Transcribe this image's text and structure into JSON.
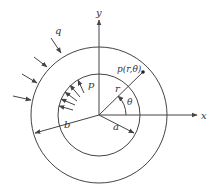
{
  "figure": {
    "labels": {
      "outer_pressure": "q",
      "inner_pressure": "p",
      "point": "p(r,θ)",
      "radius": "r",
      "angle": "θ",
      "inner_radius": "a",
      "outer_radius": "b",
      "x_axis": "x",
      "y_axis": "y"
    },
    "colors": {
      "line": "#444444",
      "text": "#333333",
      "background": "#ffffff"
    }
  }
}
